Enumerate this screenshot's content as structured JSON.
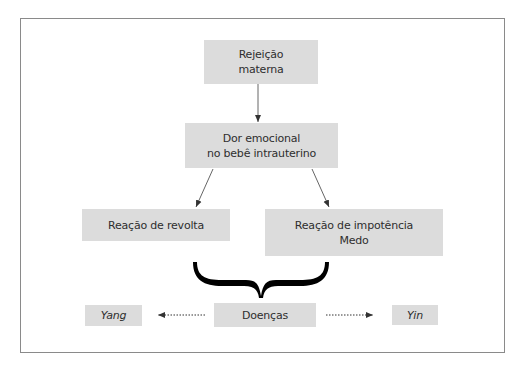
{
  "diagram": {
    "nodes": {
      "rejeicao": {
        "line1": "Rejeição",
        "line2": "materna"
      },
      "dor": {
        "line1": "Dor emocional",
        "line2": "no bebê intrauterino"
      },
      "revolta": {
        "line1": "Reação de revolta"
      },
      "impotencia": {
        "line1": "Reação de impotência",
        "line2": "Medo"
      },
      "doencas": {
        "line1": "Doenças"
      },
      "yang": {
        "line1": "Yang"
      },
      "yin": {
        "line1": "Yin"
      }
    },
    "edges": [
      {
        "from": "rejeicao",
        "to": "dor",
        "style": "solid"
      },
      {
        "from": "dor",
        "to": "revolta",
        "style": "solid"
      },
      {
        "from": "dor",
        "to": "impotencia",
        "style": "solid"
      },
      {
        "from": "revolta+impotencia",
        "to": "doencas",
        "style": "brace"
      },
      {
        "from": "doencas",
        "to": "yang",
        "style": "dotted"
      },
      {
        "from": "doencas",
        "to": "yin",
        "style": "dotted"
      }
    ],
    "colors": {
      "box_fill": "#dcdcdc",
      "line": "#555555",
      "brace": "#000000",
      "frame": "#8a8a8a"
    }
  }
}
